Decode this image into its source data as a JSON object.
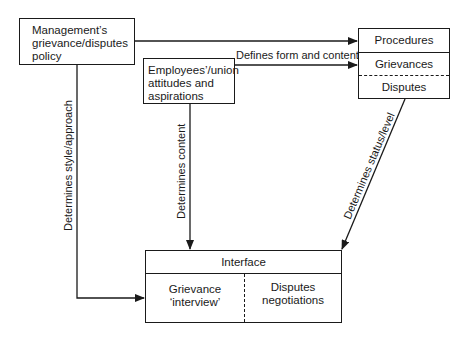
{
  "diagram": {
    "nodes": {
      "management": {
        "label_lines": [
          "Management’s",
          "grievance/disputes",
          "policy"
        ]
      },
      "employees": {
        "label_lines": [
          "Employees’/union",
          "attitudes and",
          "aspirations"
        ]
      },
      "procedures": {
        "title": "Procedures",
        "rows": [
          "Grievances",
          "Disputes"
        ]
      },
      "interface": {
        "title": "Interface",
        "left": [
          "Grievance",
          "‘interview’"
        ],
        "right": [
          "Disputes",
          "negotiations"
        ]
      }
    },
    "edges": [
      {
        "from": "management",
        "to": "procedures",
        "label": ""
      },
      {
        "from": "employees",
        "to": "procedures",
        "label": "Defines form and content"
      },
      {
        "from": "management",
        "to": "interface",
        "label": "Determines style/approach"
      },
      {
        "from": "employees",
        "to": "interface",
        "label": "Determines content"
      },
      {
        "from": "procedures",
        "to": "interface",
        "label": "Determines status/level"
      }
    ],
    "colors": {
      "line": "#1a1a1a",
      "background": "#ffffff"
    }
  }
}
